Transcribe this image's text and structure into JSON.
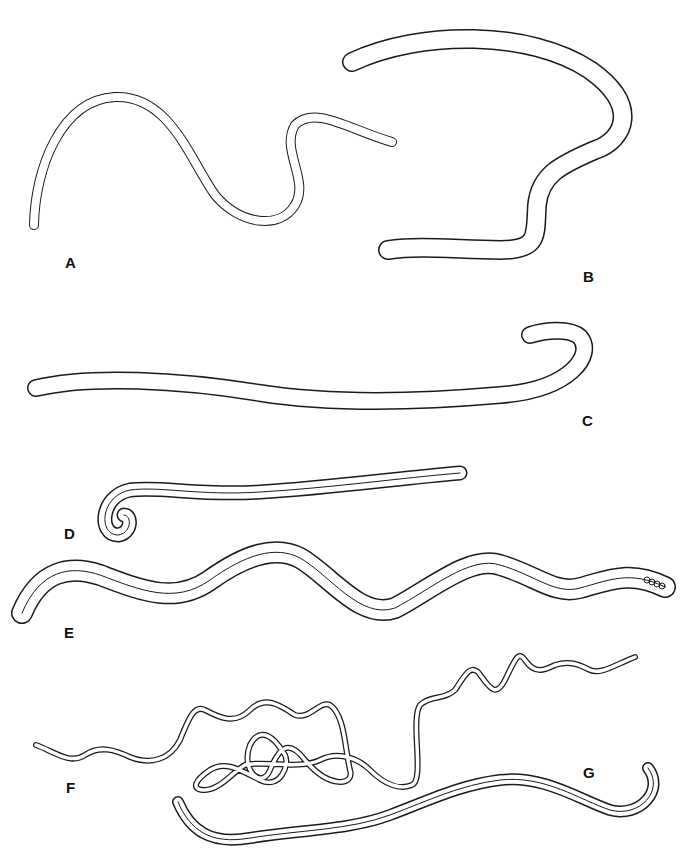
{
  "figure": {
    "background": "#ffffff",
    "line_color": "#1a1a1a",
    "panels": [
      {
        "id": "A",
        "label": "A",
        "description": "S-shaped worm outline, single wall"
      },
      {
        "id": "B",
        "label": "B",
        "description": "Large hooked worm, tail curving back"
      },
      {
        "id": "C",
        "label": "C",
        "description": "Long straight worm with hooked anterior end"
      },
      {
        "id": "D",
        "label": "D",
        "description": "Slender worm with coiled hook tip, double wall"
      },
      {
        "id": "E",
        "label": "E",
        "description": "Undulating worm, double wall, eggs at tip"
      },
      {
        "id": "F",
        "label": "F",
        "description": "Very thin coiled worm with loops"
      },
      {
        "id": "G",
        "label": "G",
        "description": "Curved worm, triple-line outline"
      }
    ]
  }
}
